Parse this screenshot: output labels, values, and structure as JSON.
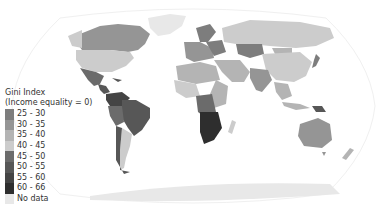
{
  "map": {
    "title": "Gini Index",
    "subtitle": "(Income equality = 0)",
    "projection": "Robinson",
    "legend": [
      {
        "label": "25 - 30",
        "color": "#7d7d7d"
      },
      {
        "label": "30 - 35",
        "color": "#959595"
      },
      {
        "label": "35 - 40",
        "color": "#b4b4b4"
      },
      {
        "label": "40 - 45",
        "color": "#cccccc"
      },
      {
        "label": "45 - 50",
        "color": "#6b6b6b"
      },
      {
        "label": "50 - 55",
        "color": "#575757"
      },
      {
        "label": "55 - 60",
        "color": "#444444"
      },
      {
        "label": "60 - 66",
        "color": "#2e2e2e"
      },
      {
        "label": "No data",
        "color": "#e8e8e8"
      }
    ],
    "regions": [
      {
        "name": "Canada",
        "bin": "30 - 35"
      },
      {
        "name": "Greenland",
        "bin": "No data"
      },
      {
        "name": "United States",
        "bin": "40 - 45"
      },
      {
        "name": "Mexico",
        "bin": "45 - 50"
      },
      {
        "name": "Central America",
        "bin": "50 - 55"
      },
      {
        "name": "Colombia/Venezuela",
        "bin": "55 - 60"
      },
      {
        "name": "Brazil",
        "bin": "50 - 55"
      },
      {
        "name": "Peru/Bolivia",
        "bin": "45 - 50"
      },
      {
        "name": "Argentina",
        "bin": "40 - 45"
      },
      {
        "name": "Chile",
        "bin": "50 - 55"
      },
      {
        "name": "Europe West",
        "bin": "30 - 35"
      },
      {
        "name": "Scandinavia",
        "bin": "25 - 30"
      },
      {
        "name": "Eastern Europe",
        "bin": "25 - 30"
      },
      {
        "name": "Russia",
        "bin": "40 - 45"
      },
      {
        "name": "Kazakhstan",
        "bin": "25 - 30"
      },
      {
        "name": "China",
        "bin": "40 - 45"
      },
      {
        "name": "Mongolia",
        "bin": "35 - 40"
      },
      {
        "name": "India",
        "bin": "30 - 35"
      },
      {
        "name": "Middle East",
        "bin": "35 - 40"
      },
      {
        "name": "Japan",
        "bin": "25 - 30"
      },
      {
        "name": "North Africa",
        "bin": "35 - 40"
      },
      {
        "name": "West Africa",
        "bin": "40 - 45"
      },
      {
        "name": "Central Africa",
        "bin": "45 - 50"
      },
      {
        "name": "Southern Africa",
        "bin": "60 - 66"
      },
      {
        "name": "East Africa",
        "bin": "35 - 40"
      },
      {
        "name": "Madagascar",
        "bin": "40 - 45"
      },
      {
        "name": "Southeast Asia",
        "bin": "35 - 40"
      },
      {
        "name": "Papua New Guinea",
        "bin": "50 - 55"
      },
      {
        "name": "Australia",
        "bin": "30 - 35"
      },
      {
        "name": "New Zealand",
        "bin": "35 - 40"
      },
      {
        "name": "Antarctica",
        "bin": "No data"
      }
    ]
  }
}
